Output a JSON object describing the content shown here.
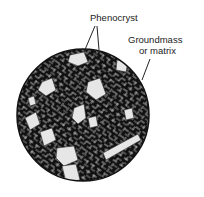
{
  "diagram": {
    "labels": {
      "phenocryst": "Phenocryst",
      "groundmass_line1": "Groundmass",
      "groundmass_line2": "or matrix"
    },
    "colors": {
      "groundmass": "#111111",
      "phenocryst": "#e6e6e6",
      "line": "#222222"
    }
  }
}
